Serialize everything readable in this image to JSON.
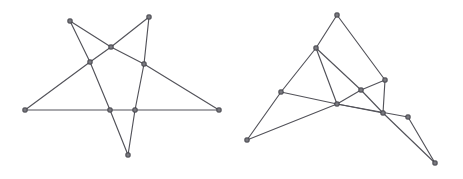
{
  "page": {
    "background_color": "#ffffff",
    "width": 463,
    "height": 179
  },
  "style": {
    "edge_color": "#53535a",
    "edge_width": 1.15,
    "vertex_fill": "#7a7a80",
    "vertex_stroke": "#3f3f45",
    "vertex_size": 4.2
  },
  "figures": [
    {
      "name": "left-figure",
      "label": "star-polygon-drawing",
      "vertices": [
        {
          "id": "L1",
          "name": "top-left-apex",
          "x": 70,
          "y": 21
        },
        {
          "id": "L2",
          "name": "top-right-apex",
          "x": 149,
          "y": 17
        },
        {
          "id": "L3",
          "name": "left-apex",
          "x": 25,
          "y": 110
        },
        {
          "id": "L4",
          "name": "right-apex",
          "x": 219,
          "y": 110
        },
        {
          "id": "L5",
          "name": "bottom-apex",
          "x": 128,
          "y": 155
        },
        {
          "id": "L6",
          "name": "upper-center-cross",
          "x": 111,
          "y": 47
        },
        {
          "id": "L7",
          "name": "left-mid-cross",
          "x": 90,
          "y": 62
        },
        {
          "id": "L8",
          "name": "right-mid-cross",
          "x": 144,
          "y": 64
        },
        {
          "id": "L9",
          "name": "base-left-cross",
          "x": 110,
          "y": 110
        },
        {
          "id": "L10",
          "name": "base-right-cross",
          "x": 135,
          "y": 110
        }
      ],
      "edges": [
        {
          "from": "L1",
          "to": "L6"
        },
        {
          "from": "L6",
          "to": "L8"
        },
        {
          "from": "L8",
          "to": "L4"
        },
        {
          "from": "L2",
          "to": "L6"
        },
        {
          "from": "L6",
          "to": "L7"
        },
        {
          "from": "L7",
          "to": "L3"
        },
        {
          "from": "L1",
          "to": "L7"
        },
        {
          "from": "L7",
          "to": "L9"
        },
        {
          "from": "L9",
          "to": "L5"
        },
        {
          "from": "L2",
          "to": "L8"
        },
        {
          "from": "L8",
          "to": "L10"
        },
        {
          "from": "L10",
          "to": "L5"
        },
        {
          "from": "L3",
          "to": "L9"
        },
        {
          "from": "L9",
          "to": "L10"
        },
        {
          "from": "L10",
          "to": "L4"
        }
      ]
    },
    {
      "name": "right-figure",
      "label": "triangle-fan-drawing",
      "vertices": [
        {
          "id": "R1",
          "name": "top-apex",
          "x": 337,
          "y": 15
        },
        {
          "id": "R2",
          "name": "upper-left-node",
          "x": 316,
          "y": 48
        },
        {
          "id": "R3",
          "name": "left-mid-node",
          "x": 281,
          "y": 92
        },
        {
          "id": "R4",
          "name": "far-left-apex",
          "x": 247,
          "y": 140
        },
        {
          "id": "R5",
          "name": "upper-right-node",
          "x": 385,
          "y": 80
        },
        {
          "id": "R6",
          "name": "center-right-node",
          "x": 361,
          "y": 90
        },
        {
          "id": "R7",
          "name": "center-node",
          "x": 337,
          "y": 104
        },
        {
          "id": "R8",
          "name": "lower-center-node",
          "x": 383,
          "y": 113
        },
        {
          "id": "R9",
          "name": "lower-right-node",
          "x": 408,
          "y": 117
        },
        {
          "id": "R10",
          "name": "far-bottom-right-apex",
          "x": 435,
          "y": 163
        }
      ],
      "edges": [
        {
          "from": "R1",
          "to": "R2"
        },
        {
          "from": "R2",
          "to": "R3"
        },
        {
          "from": "R3",
          "to": "R4"
        },
        {
          "from": "R1",
          "to": "R5"
        },
        {
          "from": "R5",
          "to": "R8"
        },
        {
          "from": "R8",
          "to": "R10"
        },
        {
          "from": "R2",
          "to": "R6"
        },
        {
          "from": "R6",
          "to": "R5"
        },
        {
          "from": "R6",
          "to": "R8"
        },
        {
          "from": "R3",
          "to": "R7"
        },
        {
          "from": "R7",
          "to": "R6"
        },
        {
          "from": "R7",
          "to": "R8"
        },
        {
          "from": "R4",
          "to": "R7"
        },
        {
          "from": "R7",
          "to": "R9"
        },
        {
          "from": "R9",
          "to": "R10"
        },
        {
          "from": "R2",
          "to": "R7"
        }
      ]
    }
  ]
}
